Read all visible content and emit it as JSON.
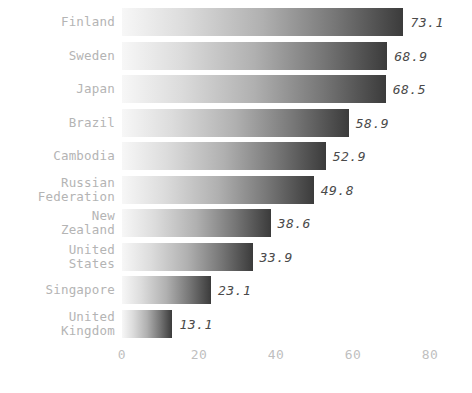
{
  "chart_data": {
    "type": "bar",
    "orientation": "horizontal",
    "title": "",
    "xlabel": "",
    "ylabel": "",
    "xlim": [
      0,
      80
    ],
    "xticks": [
      "0",
      "20",
      "40",
      "60",
      "80"
    ],
    "xtick_values": [
      0,
      20,
      40,
      60,
      80
    ],
    "grid": false,
    "legend": false,
    "categories": [
      "Finland",
      "Sweden",
      "Japan",
      "Brazil",
      "Cambodia",
      "Russian\nFederation",
      "New\nZealand",
      "United\nStates",
      "Singapore",
      "United\nKingdom"
    ],
    "values": [
      73.1,
      68.9,
      68.5,
      58.9,
      52.9,
      49.8,
      38.6,
      33.9,
      23.1,
      13.1
    ],
    "value_labels": [
      "73.1",
      "68.9",
      "68.5",
      "58.9",
      "52.9",
      "49.8",
      "38.6",
      "33.9",
      "23.1",
      "13.1"
    ],
    "bar_gradient_from": "#f7f7f7",
    "bar_gradient_to": "#3b3b3b",
    "category_label_color": "#b4b4b4",
    "value_label_color": "#4a4a4a",
    "tick_label_color": "#bfbfbf",
    "background_color": "#ffffff"
  }
}
